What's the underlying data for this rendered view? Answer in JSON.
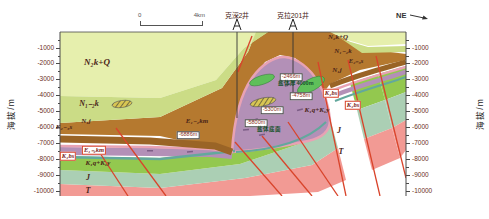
{
  "figure": {
    "direction": "NE",
    "scale": {
      "left": "0",
      "right": "4km"
    },
    "axis": {
      "label": "海拔/m",
      "ticks": [
        "-1000",
        "-2000",
        "-3000",
        "-4000",
        "-5000",
        "-6000",
        "-7000",
        "-8000",
        "-9000",
        "-10000"
      ]
    },
    "wells": [
      {
        "name": "克深2井",
        "x": 237
      },
      {
        "name": "克拉201井",
        "x": 293
      }
    ],
    "unit_labels": [
      {
        "t": "N₂k+Q",
        "x": 97,
        "y": 62,
        "s": 9
      },
      {
        "t": "N₁₋₂k",
        "x": 89,
        "y": 104,
        "s": 8
      },
      {
        "t": "E₂₋₃s",
        "x": 64,
        "y": 127,
        "s": 7
      },
      {
        "t": "N₁j",
        "x": 86,
        "y": 121,
        "s": 7
      },
      {
        "t": "E₁₋₂km",
        "x": 197,
        "y": 121,
        "s": 7
      },
      {
        "t": "N₂k+Q",
        "x": 338,
        "y": 37,
        "s": 7
      },
      {
        "t": "N₁₋₂k",
        "x": 343,
        "y": 51,
        "s": 7
      },
      {
        "t": "E₂₋₃s",
        "x": 356,
        "y": 61,
        "s": 6.5
      },
      {
        "t": "N₁j",
        "x": 337,
        "y": 70,
        "s": 7
      },
      {
        "t": "K₁q+K₁y",
        "x": 317,
        "y": 110,
        "s": 7
      },
      {
        "t": "K₁q+K₁y",
        "x": 98,
        "y": 163,
        "s": 7
      },
      {
        "t": "J",
        "x": 88,
        "y": 178,
        "s": 8
      },
      {
        "t": "T",
        "x": 88,
        "y": 191,
        "s": 8
      },
      {
        "t": "J",
        "x": 339,
        "y": 131,
        "s": 8
      },
      {
        "t": "T",
        "x": 341,
        "y": 152,
        "s": 8
      }
    ],
    "boxed_labels": [
      {
        "t": "E₁₋₂km",
        "x": 94,
        "y": 150
      },
      {
        "t": "K₁bs",
        "x": 68,
        "y": 156
      },
      {
        "t": "K₁bs",
        "x": 331,
        "y": 93
      },
      {
        "t": "K₁bs",
        "x": 353,
        "y": 105
      }
    ],
    "annotations": [
      {
        "t": "-2466m",
        "x": 291,
        "y": 77,
        "kind": "box"
      },
      {
        "t": "盐体厚4000m",
        "x": 296,
        "y": 84,
        "kind": "green"
      },
      {
        "t": "-4758m",
        "x": 301,
        "y": 96,
        "kind": "box"
      },
      {
        "t": "-5300m",
        "x": 272,
        "y": 110,
        "kind": "box"
      },
      {
        "t": "-5800m",
        "x": 256,
        "y": 123,
        "kind": "box"
      },
      {
        "t": "盐体底面",
        "x": 269,
        "y": 130,
        "kind": "green"
      },
      {
        "t": "-6886m",
        "x": 188,
        "y": 135,
        "kind": "box"
      }
    ],
    "colors": {
      "nq": "#e6efad",
      "n12k": "#cbdc86",
      "n1j": "#b5792f",
      "e23s": "#9a6426",
      "pink": "#e8a2b4",
      "ekm": "#b390b7",
      "ekm_dash": "#7c5d86",
      "k1bs": "#63a89d",
      "kqy": "#93c84f",
      "j": "#abcfb4",
      "t": "#f29a94",
      "fault": "#d9442b",
      "salt": "#5fbf5a",
      "hatch": "#d8c653",
      "axis_text": "#6b2f23",
      "label_text": "#4a2418",
      "line": "#4a4a4a"
    }
  }
}
